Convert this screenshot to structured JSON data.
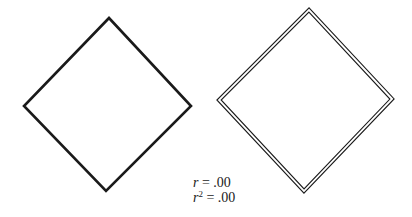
{
  "figure": {
    "width": 412,
    "height": 217,
    "background": "#ffffff",
    "stroke_color": "#1a1a1a",
    "left_diamond": {
      "style": "single-line",
      "stroke_width": 2.6,
      "points": [
        [
          109,
          18
        ],
        [
          191,
          106
        ],
        [
          106,
          191
        ],
        [
          24,
          106
        ]
      ]
    },
    "right_diamond": {
      "style": "double-line",
      "stroke_width": 1.1,
      "gap": 3,
      "points": [
        [
          309,
          10
        ],
        [
          392,
          99
        ],
        [
          304,
          191
        ],
        [
          219,
          100
        ]
      ]
    }
  },
  "stats": {
    "r_label": "r",
    "r_value": "= .00",
    "r2_label": "r",
    "r2_exponent": "2",
    "r2_value": "= .00"
  }
}
